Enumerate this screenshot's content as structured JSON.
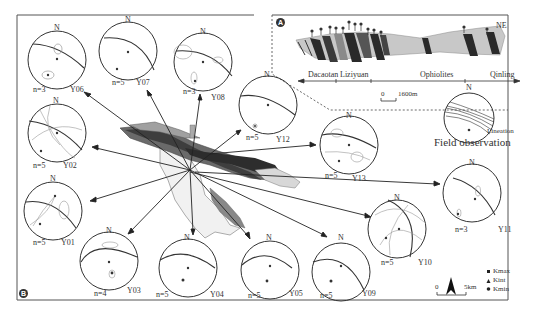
{
  "figure": {
    "panel_a": {
      "badge": "A",
      "direction": "NE",
      "units": [
        "Dacaotan",
        "Liziyuan",
        "Ophiolites",
        "Qinling"
      ],
      "scale_zero": "0",
      "scale_label": "1600m",
      "field_title": "Field observation",
      "field_stereonet": {
        "north": "N",
        "legend": "Lineation"
      }
    },
    "panel_b": {
      "badge": "B",
      "scale_zero": "0",
      "scale_label": "5km",
      "legend": [
        {
          "symbol": "square",
          "label": "Kmax"
        },
        {
          "symbol": "triangle",
          "label": "Kint"
        },
        {
          "symbol": "circle",
          "label": "Kmin"
        }
      ],
      "stereonets": [
        {
          "site": "Y06",
          "n": "n=3",
          "north": "N"
        },
        {
          "site": "Y07",
          "n": "n=5",
          "north": "N"
        },
        {
          "site": "Y08",
          "n": "n=3",
          "north": "N"
        },
        {
          "site": "Y12",
          "n": "n=5",
          "north": "N"
        },
        {
          "site": "Y02",
          "n": "n=5",
          "north": "N"
        },
        {
          "site": "Y13",
          "n": "n=5",
          "north": "N"
        },
        {
          "site": "Y01",
          "n": "n=5",
          "north": "N"
        },
        {
          "site": "Y11",
          "n": "n=3",
          "north": "N"
        },
        {
          "site": "Y10",
          "n": "n=5",
          "north": "N"
        },
        {
          "site": "Y03",
          "n": "n=4",
          "north": "N"
        },
        {
          "site": "Y04",
          "n": "n=5",
          "north": "N"
        },
        {
          "site": "Y05",
          "n": "n=5",
          "north": "N"
        },
        {
          "site": "Y09",
          "n": "n=5",
          "north": "N"
        }
      ]
    }
  }
}
